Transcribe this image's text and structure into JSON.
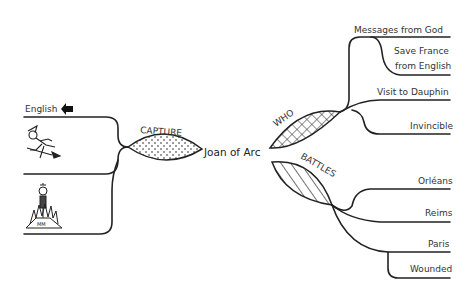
{
  "mindmap": {
    "center": {
      "label": "Joan of Arc"
    },
    "branches": [
      {
        "id": "capture",
        "label": "CAPTURE",
        "pattern": "dots",
        "children": [
          {
            "label": "English",
            "icon": "arrow-left-icon"
          },
          {
            "label": "",
            "icon": "witch-on-broom-icon"
          },
          {
            "label": "",
            "icon": "burning-at-stake-icon"
          }
        ]
      },
      {
        "id": "who",
        "label": "WHO",
        "pattern": "crosshatch",
        "children": [
          {
            "label": "Messages from God"
          },
          {
            "label_line1": "Save France",
            "label_line2": "from English"
          },
          {
            "label": "Visit to Dauphin"
          },
          {
            "label": "Invincible"
          }
        ]
      },
      {
        "id": "battles",
        "label": "BATTLES",
        "pattern": "diagonal-stripes",
        "children": [
          {
            "label": "Orléans"
          },
          {
            "label": "Reims"
          },
          {
            "label": "Paris"
          },
          {
            "label": "Wounded"
          }
        ]
      }
    ]
  },
  "colors": {
    "stroke": "#222222",
    "text": "#333333",
    "background": "#ffffff"
  }
}
